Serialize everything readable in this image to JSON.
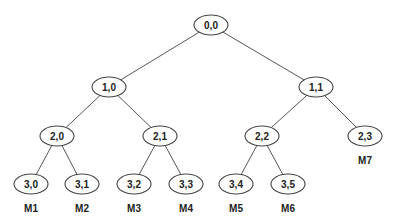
{
  "diagram": {
    "type": "binary-tree",
    "node_rx": 17,
    "node_ry": 10,
    "nodes": [
      {
        "id": "0,0",
        "label": "0,0",
        "x": 211,
        "y": 25
      },
      {
        "id": "1,0",
        "label": "1,0",
        "x": 109,
        "y": 87
      },
      {
        "id": "1,1",
        "label": "1,1",
        "x": 316,
        "y": 87
      },
      {
        "id": "2,0",
        "label": "2,0",
        "x": 57,
        "y": 136
      },
      {
        "id": "2,1",
        "label": "2,1",
        "x": 160,
        "y": 136
      },
      {
        "id": "2,2",
        "label": "2,2",
        "x": 262,
        "y": 136
      },
      {
        "id": "2,3",
        "label": "2,3",
        "x": 365,
        "y": 136
      },
      {
        "id": "3,0",
        "label": "3,0",
        "x": 31,
        "y": 184
      },
      {
        "id": "3,1",
        "label": "3,1",
        "x": 82,
        "y": 184
      },
      {
        "id": "3,2",
        "label": "3,2",
        "x": 134,
        "y": 184
      },
      {
        "id": "3,3",
        "label": "3,3",
        "x": 186,
        "y": 184
      },
      {
        "id": "3,4",
        "label": "3,4",
        "x": 236,
        "y": 184
      },
      {
        "id": "3,5",
        "label": "3,5",
        "x": 288,
        "y": 184
      }
    ],
    "edges": [
      [
        "0,0",
        "1,0"
      ],
      [
        "0,0",
        "1,1"
      ],
      [
        "1,0",
        "2,0"
      ],
      [
        "1,0",
        "2,1"
      ],
      [
        "1,1",
        "2,2"
      ],
      [
        "1,1",
        "2,3"
      ],
      [
        "2,0",
        "3,0"
      ],
      [
        "2,0",
        "3,1"
      ],
      [
        "2,1",
        "3,2"
      ],
      [
        "2,1",
        "3,3"
      ],
      [
        "2,2",
        "3,4"
      ],
      [
        "2,2",
        "3,5"
      ]
    ],
    "leaf_labels": [
      {
        "label": "M1",
        "node": "3,0",
        "x": 31,
        "y": 212
      },
      {
        "label": "M2",
        "node": "3,1",
        "x": 82,
        "y": 212
      },
      {
        "label": "M3",
        "node": "3,2",
        "x": 134,
        "y": 212
      },
      {
        "label": "M4",
        "node": "3,3",
        "x": 186,
        "y": 212
      },
      {
        "label": "M5",
        "node": "3,4",
        "x": 236,
        "y": 212
      },
      {
        "label": "M6",
        "node": "3,5",
        "x": 288,
        "y": 212
      },
      {
        "label": "M7",
        "node": "2,3",
        "x": 365,
        "y": 164
      }
    ],
    "colors": {
      "background": "#ffffff",
      "stroke": "#444444",
      "text": "#222222"
    }
  }
}
